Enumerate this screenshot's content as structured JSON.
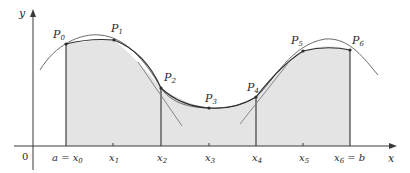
{
  "figure": {
    "colors": {
      "axis": "#3a3a3a",
      "curve": "#6b6b6b",
      "polygon": "#2e2e2e",
      "shade": "#e4e4e4",
      "tangent": "#7a7a7a"
    },
    "axes": {
      "x_label": "x",
      "y_label": "y",
      "origin_label": "0"
    },
    "ticks": [
      {
        "id": "x0",
        "main": "a = x",
        "sub": "0"
      },
      {
        "id": "x1",
        "main": "x",
        "sub": "1"
      },
      {
        "id": "x2",
        "main": "x",
        "sub": "2"
      },
      {
        "id": "x3",
        "main": "x",
        "sub": "3"
      },
      {
        "id": "x4",
        "main": "x",
        "sub": "4"
      },
      {
        "id": "x5",
        "main": "x",
        "sub": "5"
      },
      {
        "id": "x6",
        "main": "x",
        "sub": "6",
        "suffix": " = b"
      }
    ],
    "points": [
      {
        "id": "P0",
        "main": "P",
        "sub": "0"
      },
      {
        "id": "P1",
        "main": "P",
        "sub": "1"
      },
      {
        "id": "P2",
        "main": "P",
        "sub": "2"
      },
      {
        "id": "P3",
        "main": "P",
        "sub": "3"
      },
      {
        "id": "P4",
        "main": "P",
        "sub": "4"
      },
      {
        "id": "P5",
        "main": "P",
        "sub": "5"
      },
      {
        "id": "P6",
        "main": "P",
        "sub": "6"
      }
    ]
  }
}
